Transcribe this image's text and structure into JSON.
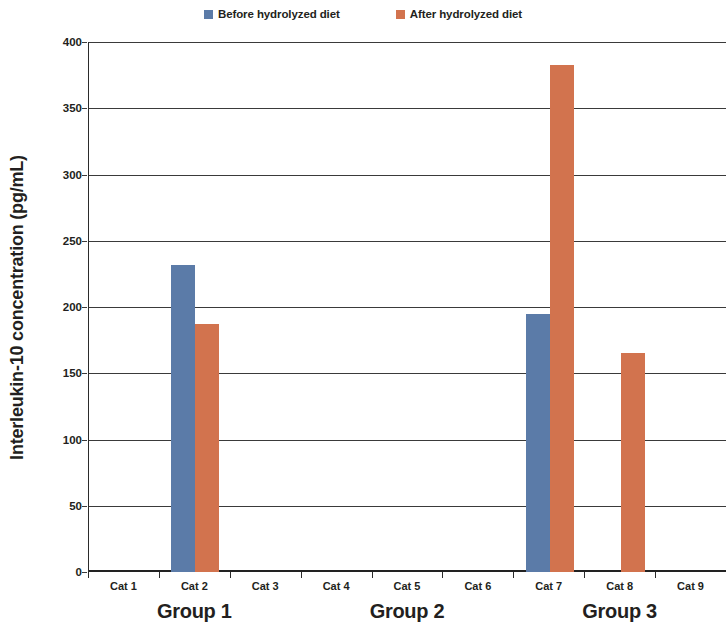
{
  "chart_data": {
    "type": "bar",
    "title": "",
    "subtitle": "",
    "xlabel": "",
    "ylabel": "Interleukin-10 concentration (pg/mL)",
    "categories": [
      "Cat 1",
      "Cat 2",
      "Cat 3",
      "Cat 4",
      "Cat 5",
      "Cat 6",
      "Cat 7",
      "Cat 8",
      "Cat 9"
    ],
    "series": [
      {
        "name": "Before hydrolyzed diet",
        "color": "#5b7ba8",
        "values": [
          null,
          232,
          null,
          null,
          null,
          null,
          195,
          null,
          null
        ]
      },
      {
        "name": "After hydrolyzed diet",
        "color": "#d2734e",
        "values": [
          null,
          187,
          null,
          null,
          null,
          null,
          383,
          165,
          null
        ]
      }
    ],
    "ylim": [
      0,
      400
    ],
    "yticks": [
      0,
      50,
      100,
      150,
      200,
      250,
      300,
      350,
      400
    ],
    "ytick_labels": [
      "0",
      "50",
      "100",
      "150",
      "200",
      "250",
      "300",
      "350",
      "400"
    ],
    "grid": "horizontal",
    "legend_position": "top-center",
    "groups": [
      {
        "label": "Group 1",
        "categories": [
          "Cat 1",
          "Cat 2",
          "Cat 3"
        ]
      },
      {
        "label": "Group 2",
        "categories": [
          "Cat 4",
          "Cat 5",
          "Cat 6"
        ]
      },
      {
        "label": "Group 3",
        "categories": [
          "Cat 7",
          "Cat 8",
          "Cat 9"
        ]
      }
    ]
  },
  "legend": {
    "entries": [
      {
        "label": "Before hydrolyzed diet",
        "color": "#5b7ba8"
      },
      {
        "label": "After hydrolyzed diet",
        "color": "#d2734e"
      }
    ]
  },
  "axes": {
    "y_title": "Interleukin-10 concentration (pg/mL)"
  }
}
